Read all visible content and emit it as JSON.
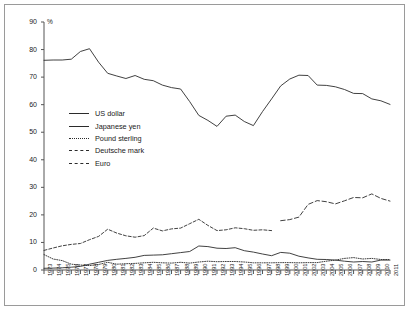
{
  "chart_data": {
    "type": "line",
    "title": "",
    "subtitle": "",
    "unit_label": "%",
    "xlabel": "",
    "ylabel": "%",
    "ylim": [
      0,
      90
    ],
    "ytick_step": 10,
    "yticks": [
      0,
      10,
      20,
      30,
      40,
      50,
      60,
      70,
      80,
      90
    ],
    "grid": false,
    "legend_position": "inside-left",
    "x": [
      1973,
      1974,
      1975,
      1976,
      1977,
      1978,
      1979,
      1980,
      1981,
      1982,
      1983,
      1984,
      1985,
      1986,
      1987,
      1988,
      1989,
      1990,
      1991,
      1992,
      1993,
      1994,
      1995,
      1996,
      1997,
      1998,
      1999,
      2000,
      2001,
      2002,
      2003,
      2004,
      2005,
      2006,
      2007,
      2008,
      2009,
      2010,
      2011
    ],
    "categories": [
      "1973",
      "1974",
      "1975",
      "1976",
      "1977",
      "1978",
      "1979",
      "1980",
      "1981",
      "1982",
      "1983",
      "1984",
      "1985",
      "1986",
      "1987",
      "1988",
      "1989",
      "1990",
      "1991",
      "1992",
      "1993",
      "1994",
      "1995",
      "1996",
      "1997",
      "1998",
      "1999",
      "2000",
      "2001",
      "2002",
      "2003",
      "2004",
      "2005",
      "2006",
      "2007",
      "2008",
      "2009",
      "2010",
      "2011"
    ],
    "series": [
      {
        "name": "US dollar",
        "style": "solid",
        "color": "#2b2b2b",
        "values": [
          76.1,
          76.2,
          76.2,
          76.5,
          79.3,
          80.3,
          75.4,
          71.4,
          70.4,
          69.5,
          70.6,
          69.2,
          68.7,
          67.1,
          66.2,
          65.7,
          61.1,
          56.1,
          54.3,
          52.1,
          55.8,
          56.2,
          53.9,
          52.4,
          57.5,
          62.1,
          66.8,
          69.3,
          70.7,
          70.6,
          67.1,
          67.0,
          66.5,
          65.5,
          64.1,
          64.0,
          62.1,
          61.4,
          60.1
        ]
      },
      {
        "name": "Japanese yen",
        "style": "solid",
        "color": "#2b2b2b",
        "values": [
          0.6,
          0.7,
          0.8,
          1.0,
          1.3,
          2.1,
          2.8,
          3.5,
          3.9,
          4.2,
          4.6,
          5.3,
          5.4,
          5.5,
          5.9,
          6.3,
          6.7,
          8.7,
          8.5,
          7.9,
          7.8,
          8.1,
          7.0,
          6.5,
          5.8,
          5.2,
          6.4,
          6.1,
          5.0,
          4.4,
          3.9,
          3.8,
          3.6,
          3.2,
          2.9,
          3.1,
          2.9,
          3.6,
          3.6
        ]
      },
      {
        "name": "Pound sterling",
        "style": "dotted",
        "color": "#2b2b2b",
        "values": [
          5.6,
          4.0,
          3.4,
          2.1,
          1.8,
          1.6,
          2.0,
          2.8,
          2.1,
          2.3,
          2.4,
          2.6,
          2.8,
          2.6,
          2.5,
          2.8,
          2.5,
          2.9,
          3.2,
          3.0,
          3.1,
          3.1,
          2.9,
          2.6,
          2.6,
          2.6,
          2.7,
          2.7,
          2.6,
          2.7,
          2.7,
          3.2,
          3.6,
          4.2,
          4.5,
          4.0,
          4.2,
          3.8,
          3.8
        ]
      },
      {
        "name": "Deutsche mark",
        "style": "dashed",
        "color": "#2b2b2b",
        "values": [
          7.1,
          8.0,
          8.8,
          9.3,
          9.6,
          11.0,
          12.2,
          14.8,
          13.4,
          12.4,
          11.9,
          12.5,
          15.2,
          14.2,
          14.9,
          15.2,
          16.8,
          18.4,
          16.2,
          14.3,
          14.6,
          15.3,
          15.0,
          14.4,
          14.6,
          14.3,
          null,
          null,
          null,
          null,
          null,
          null,
          null,
          null,
          null,
          null,
          null,
          null,
          null
        ]
      },
      {
        "name": "Euro",
        "style": "dashed-long",
        "color": "#2b2b2b",
        "values": [
          null,
          null,
          null,
          null,
          null,
          null,
          null,
          null,
          null,
          null,
          null,
          null,
          null,
          null,
          null,
          null,
          null,
          null,
          null,
          null,
          null,
          null,
          null,
          null,
          null,
          null,
          17.9,
          18.3,
          19.2,
          23.8,
          25.2,
          24.8,
          24.0,
          25.1,
          26.3,
          26.2,
          27.6,
          26.0,
          25.0
        ]
      }
    ],
    "legend": [
      {
        "label": "US dollar",
        "style": "solid"
      },
      {
        "label": "Japanese yen",
        "style": "solid"
      },
      {
        "label": "Pound sterling",
        "style": "dotted"
      },
      {
        "label": "Deutsche mark",
        "style": "dashed"
      },
      {
        "label": "Euro",
        "style": "dashed-long"
      }
    ]
  }
}
